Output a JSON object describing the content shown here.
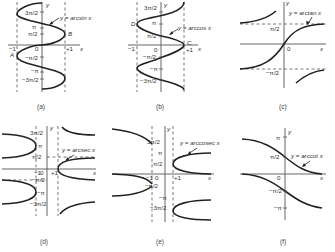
{
  "figure": {
    "panels": [
      {
        "id": "a",
        "caption": "(a)",
        "function_label": "y = arcsin x",
        "axis_labels": {
          "x": "x",
          "y": "y",
          "origin": "0",
          "neg_one": "−1",
          "pos_one": "+1"
        },
        "tick_labels": [
          "3π/2",
          "π",
          "π/2",
          "−π/2",
          "−π",
          "−3π/2"
        ],
        "point_labels": [
          "A",
          "B"
        ]
      },
      {
        "id": "b",
        "caption": "(b)",
        "function_label": "y = arccos x",
        "axis_labels": {
          "x": "x",
          "y": "y",
          "origin": "0",
          "neg_one": "−1",
          "pos_one": "+1"
        },
        "tick_labels": [
          "3π/2",
          "π",
          "π/2",
          "−π/2",
          "−π",
          "−3π/2"
        ],
        "point_labels": [
          "C",
          "D"
        ]
      },
      {
        "id": "c",
        "caption": "(c)",
        "function_label": "y = arctan x",
        "axis_labels": {
          "x": "x",
          "y": "y",
          "origin": "0"
        },
        "tick_labels": [
          "π/2",
          "−π/2"
        ]
      },
      {
        "id": "d",
        "caption": "(d)",
        "function_label": "y = arcsec x",
        "axis_labels": {
          "x": "x",
          "y": "y",
          "origin": "0",
          "neg_one": "−1",
          "pos_one": "+1"
        },
        "tick_labels": [
          "3π/2",
          "π",
          "π/2",
          "−π/2",
          "−π",
          "−3π/2"
        ]
      },
      {
        "id": "e",
        "caption": "(e)",
        "function_label": "y = arccosec x",
        "axis_labels": {
          "x": "x",
          "y": "y",
          "origin": "0",
          "neg_one": "−1",
          "pos_one": "+1"
        },
        "tick_labels": [
          "3π/2",
          "π",
          "π/2",
          "−π/2",
          "−π",
          "−3π/2"
        ]
      },
      {
        "id": "f",
        "caption": "(f)",
        "function_label": "y = arccot x",
        "axis_labels": {
          "x": "x",
          "y": "y",
          "origin": "0"
        },
        "tick_labels": [
          "π",
          "π/2",
          "−π/2",
          "−π"
        ]
      }
    ]
  }
}
